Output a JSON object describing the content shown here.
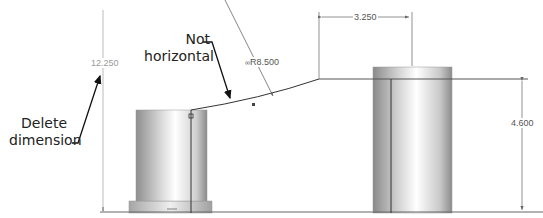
{
  "callouts": {
    "delete_dimension": {
      "line1": "Delete",
      "line2": "dimension"
    },
    "not_horizontal": {
      "line1": "Not",
      "line2": "horizontal"
    }
  },
  "dimensions": {
    "overall_height": "12.250",
    "arc_radius": "R8.500",
    "arc_radius_prefix_icon": "linked-dimension-icon",
    "horizontal_offset": "3.250",
    "right_height": "4.600"
  },
  "colors": {
    "line": "#333333",
    "dimension_line": "#777777",
    "callout_arrow": "#111111",
    "gray_dimension_text": "#999999"
  }
}
